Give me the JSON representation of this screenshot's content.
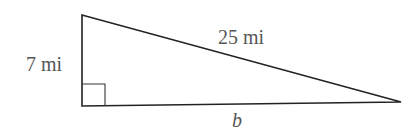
{
  "diagram": {
    "type": "right-triangle",
    "labels": {
      "vertical_leg": "7 mi",
      "hypotenuse": "25 mi",
      "horizontal_leg": "b"
    },
    "right_angle_marker": true,
    "line_color": "#222222",
    "text_color": "#555555"
  }
}
